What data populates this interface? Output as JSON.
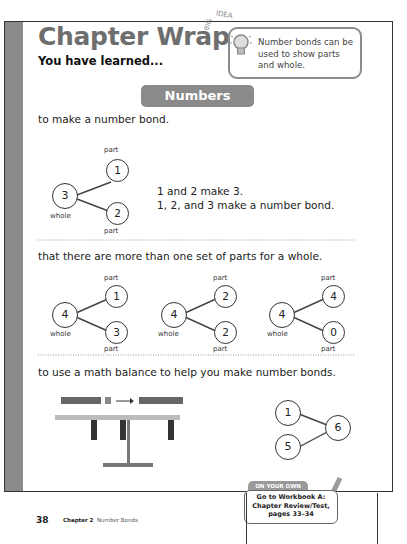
{
  "page": {
    "title": "Chapter Wrap Up",
    "subtitle": "You have learned...",
    "big_idea": {
      "label": "BIG IDEA",
      "text": "Number bonds can be used to show parts and whole."
    },
    "section_banner": "Numbers Bonds",
    "sections": [
      {
        "heading": "to make a number bond.",
        "bond": {
          "whole": "3",
          "parts": [
            "1",
            "2"
          ],
          "whole_label": "whole",
          "part_label": "part"
        },
        "explanation": [
          "1 and 2 make 3.",
          "1, 2, and 3 make a number bond."
        ]
      },
      {
        "heading": "that there are more than one set of parts for a whole.",
        "bonds": [
          {
            "whole": "4",
            "parts": [
              "1",
              "3"
            ],
            "whole_label": "whole",
            "part_label": "part"
          },
          {
            "whole": "4",
            "parts": [
              "2",
              "2"
            ],
            "whole_label": "whole",
            "part_label": "part"
          },
          {
            "whole": "4",
            "parts": [
              "4",
              "0"
            ],
            "whole_label": "whole",
            "part_label": "part"
          }
        ]
      },
      {
        "heading": "to use a math balance to help you make number bonds.",
        "bond": {
          "whole": "6",
          "parts": [
            "1",
            "5"
          ]
        }
      }
    ],
    "on_your_own": {
      "tab": "ON YOUR OWN",
      "text": "Go to Workbook A: Chapter Review/Test, pages 33–34"
    },
    "footer": {
      "page_number": "38",
      "chapter": "Chapter 2",
      "chapter_name": "Number Bonds"
    }
  }
}
